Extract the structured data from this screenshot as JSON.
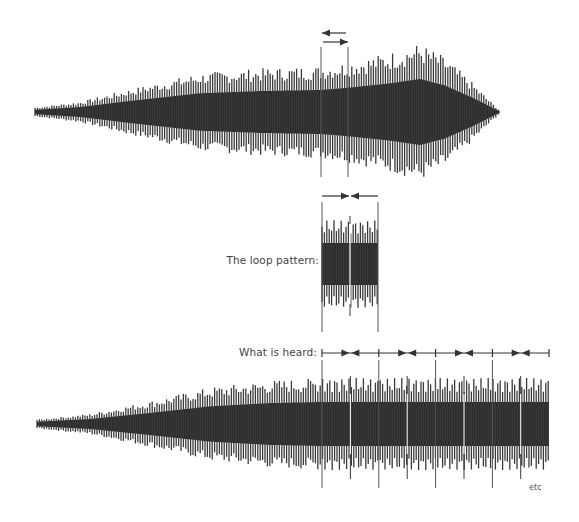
{
  "diagram": {
    "labels": {
      "loop_pattern": "The loop pattern:",
      "what_is_heard": "What is heard:",
      "etc": "etc"
    },
    "colors": {
      "waveform": "#2b2b2b",
      "spike": "#3a3a3a",
      "line": "#555555",
      "arrow": "#333333"
    },
    "original_waveform": {
      "x_start": 35,
      "x_end": 500,
      "center_y": 112,
      "envelope": [
        [
          35,
          4
        ],
        [
          80,
          9
        ],
        [
          130,
          20
        ],
        [
          200,
          34
        ],
        [
          260,
          38
        ],
        [
          321,
          40
        ],
        [
          348,
          44
        ],
        [
          390,
          52
        ],
        [
          420,
          60
        ],
        [
          445,
          48
        ],
        [
          470,
          28
        ],
        [
          490,
          10
        ],
        [
          500,
          1
        ]
      ],
      "loop_start_x": 321,
      "loop_end_x": 348,
      "marker_line_top": 47,
      "marker_line_bottom": 177,
      "arrows": [
        {
          "direction": "left",
          "y": 33,
          "x1": 322,
          "x2": 346
        },
        {
          "direction": "right",
          "y": 42,
          "x1": 323,
          "x2": 348
        }
      ]
    },
    "loop_pattern": {
      "x_start": 322,
      "x_end": 378,
      "center_y": 264,
      "amplitude": 38,
      "marker_line_top": 202,
      "marker_line_bottom": 332,
      "seam_x": 350,
      "arrows": [
        {
          "direction": "right",
          "y": 196,
          "x1": 322,
          "x2": 349
        },
        {
          "direction": "left",
          "y": 196,
          "x1": 351,
          "x2": 378
        }
      ]
    },
    "heard_waveform": {
      "x_start": 37,
      "x_end": 549,
      "center_y": 424,
      "envelope": [
        [
          37,
          4
        ],
        [
          90,
          9
        ],
        [
          150,
          20
        ],
        [
          210,
          32
        ],
        [
          270,
          38
        ],
        [
          322,
          40
        ],
        [
          549,
          40
        ]
      ],
      "loop_period": 56.8,
      "loop_start_x": 322,
      "timeline_y": 353,
      "timeline_x1": 322,
      "timeline_x2": 549,
      "boundaries": [
        322,
        378.8,
        435.6,
        492.4,
        549
      ],
      "marker_line_top": 360,
      "marker_line_bottom": 488
    }
  }
}
